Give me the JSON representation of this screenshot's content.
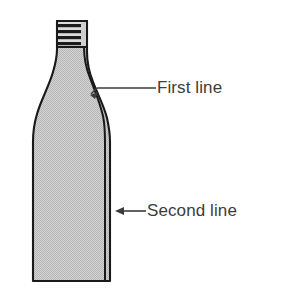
{
  "figure": {
    "colors": {
      "fill": "#c9c9c9",
      "outline": "#1a1a1a",
      "text": "#3c3c3c",
      "leader": "#3c3c3c",
      "background": "#ffffff",
      "hatch_dark": "#151515",
      "hatch_light": "#d8d8d8"
    },
    "annotations": [
      {
        "id": "first-line",
        "label": "First line",
        "target": "inner shoulder contour",
        "arrow_direction": "left-down",
        "leader_y": 88,
        "leader_x_start": 96,
        "leader_x_end": 156,
        "arrow_tip_x": 92,
        "arrow_tip_y": 93
      },
      {
        "id": "second-line",
        "label": "Second line",
        "target": "outer body edge",
        "arrow_direction": "left",
        "leader_y": 211,
        "leader_x_start": 119,
        "leader_x_end": 146,
        "arrow_tip_x": 116,
        "arrow_tip_y": 211
      }
    ],
    "parts": [
      {
        "id": "neck",
        "label": "neck",
        "hatched": true,
        "hatch_orientation": "horizontal",
        "hatch_bands": 5
      },
      {
        "id": "shoulder",
        "label": "shoulder",
        "hatched": false
      },
      {
        "id": "body",
        "label": "body",
        "hatched": false
      },
      {
        "id": "base",
        "label": "base",
        "hatched": false
      }
    ]
  }
}
